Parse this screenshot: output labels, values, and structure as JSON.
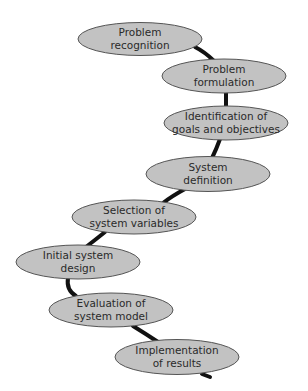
{
  "diagram": {
    "type": "process-flow",
    "colors": {
      "node_fill": "#c2c2c2",
      "node_stroke": "#555555",
      "connector": "#111111",
      "text": "#2a2a2a"
    },
    "nodes": [
      {
        "id": "problem-recognition",
        "lines": [
          "Problem",
          "recognition"
        ],
        "cx": 140,
        "cy": 39
      },
      {
        "id": "problem-formulation",
        "lines": [
          "Problem",
          "formulation"
        ],
        "cx": 224,
        "cy": 76
      },
      {
        "id": "identification-of-goals",
        "lines": [
          "Identification of",
          "goals and objectives"
        ],
        "cx": 226,
        "cy": 123
      },
      {
        "id": "system-definition",
        "lines": [
          "System",
          "definition"
        ],
        "cx": 208,
        "cy": 174
      },
      {
        "id": "selection-of-variables",
        "lines": [
          "Selection of",
          "system variables"
        ],
        "cx": 134,
        "cy": 217
      },
      {
        "id": "initial-system-design",
        "lines": [
          "Initial system",
          "design"
        ],
        "cx": 78,
        "cy": 262
      },
      {
        "id": "evaluation-of-model",
        "lines": [
          "Evaluation of",
          "system model"
        ],
        "cx": 111,
        "cy": 310
      },
      {
        "id": "implementation-of-results",
        "lines": [
          "Implementation",
          "of results"
        ],
        "cx": 177,
        "cy": 357
      }
    ]
  }
}
